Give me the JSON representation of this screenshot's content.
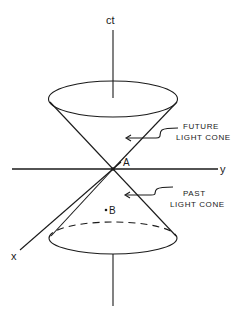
{
  "diagram": {
    "axes": {
      "time_label": "ct",
      "y_label": "y",
      "x_label": "x"
    },
    "points": {
      "apex_label": "A",
      "event_label": "B"
    },
    "annotations": {
      "future_line1": "FUTURE",
      "future_line2": "LIGHT CONE",
      "past_line1": "PAST",
      "past_line2": "LIGHT CONE"
    },
    "colors": {
      "ink": "#1a1a1a",
      "background": "#ffffff"
    }
  }
}
